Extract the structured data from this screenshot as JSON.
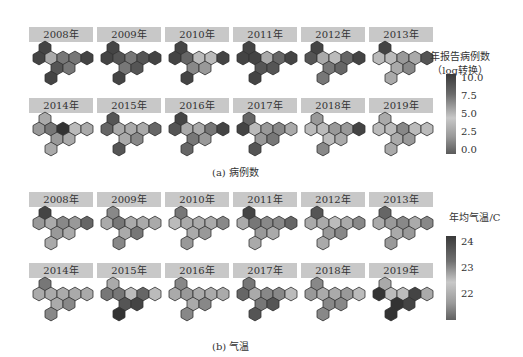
{
  "chart_data": [
    {
      "type": "heatmap",
      "subtitle": "(a) 病例数",
      "legend_title": [
        "年报告病例数",
        "（log转换）"
      ],
      "legend_ticks": [
        "10.0",
        "7.5",
        "5.0",
        "2.5",
        "0.0"
      ],
      "range": [
        0,
        10
      ],
      "panels": [
        {
          "year": "2008年",
          "cells": [
            "#444",
            "#444",
            "#aaa",
            "#777",
            "#777",
            "#444",
            "#555",
            "#777",
            "#444"
          ]
        },
        {
          "year": "2009年",
          "cells": [
            "#444",
            "#444",
            "#555",
            "#777",
            "#555",
            "#444",
            "#777",
            "#555",
            "#444"
          ]
        },
        {
          "year": "2010年",
          "cells": [
            "#444",
            "#444",
            "#666",
            "#bbb",
            "#bbb",
            "#444",
            "#888",
            "#999",
            "#444"
          ]
        },
        {
          "year": "2011年",
          "cells": [
            "#444",
            "#444",
            "#444",
            "#aaa",
            "#666",
            "#444",
            "#555",
            "#555",
            "#444"
          ]
        },
        {
          "year": "2012年",
          "cells": [
            "#444",
            "#555",
            "#aaa",
            "#bbb",
            "#666",
            "#444",
            "#777",
            "#666",
            "#777"
          ]
        },
        {
          "year": "2013年",
          "cells": [
            "#444",
            "#bbb",
            "#bbb",
            "#999",
            "#aaa",
            "#555",
            "#aaa",
            "#888",
            "#aaa"
          ]
        },
        {
          "year": "2014年",
          "cells": [
            "#aaa",
            "#999",
            "#777",
            "#333",
            "#bbb",
            "#aaa",
            "#999",
            "#aaa",
            "#aaa"
          ]
        },
        {
          "year": "2015年",
          "cells": [
            "#555",
            "#666",
            "#aaa",
            "#aaa",
            "#aaa",
            "#666",
            "#aaa",
            "#888",
            "#555"
          ]
        },
        {
          "year": "2016年",
          "cells": [
            "#444",
            "#555",
            "#aaa",
            "#aaa",
            "#777",
            "#444",
            "#777",
            "#999",
            "#666"
          ]
        },
        {
          "year": "2017年",
          "cells": [
            "#666",
            "#444",
            "#bbb",
            "#999",
            "#888",
            "#aaa",
            "#999",
            "#777",
            "#555"
          ]
        },
        {
          "year": "2018年",
          "cells": [
            "#999",
            "#bbb",
            "#bbb",
            "#999",
            "#999",
            "#444",
            "#bbb",
            "#aaa",
            "#888"
          ]
        },
        {
          "year": "2019年",
          "cells": [
            "#aaa",
            "#bbb",
            "#bbb",
            "#888",
            "#bbb",
            "#bbb",
            "#aaa",
            "#999",
            "#aaa"
          ]
        }
      ]
    },
    {
      "type": "heatmap",
      "subtitle": "(b) 气温",
      "legend_title": [
        "年均气温/C"
      ],
      "legend_ticks": [
        "24",
        "23",
        "22"
      ],
      "range": [
        21.5,
        24.3
      ],
      "panels": [
        {
          "year": "2008年",
          "cells": [
            "#444",
            "#999",
            "#aaa",
            "#888",
            "#999",
            "#666",
            "#999",
            "#aaa",
            "#aaa"
          ]
        },
        {
          "year": "2009年",
          "cells": [
            "#888",
            "#aaa",
            "#777",
            "#aaa",
            "#aaa",
            "#aaa",
            "#aaa",
            "#777",
            "#888"
          ]
        },
        {
          "year": "2010年",
          "cells": [
            "#777",
            "#bbb",
            "#aaa",
            "#aaa",
            "#aaa",
            "#888",
            "#aaa",
            "#999",
            "#999"
          ]
        },
        {
          "year": "2011年",
          "cells": [
            "#444",
            "#aaa",
            "#777",
            "#888",
            "#888",
            "#666",
            "#999",
            "#aaa",
            "#aaa"
          ]
        },
        {
          "year": "2012年",
          "cells": [
            "#555",
            "#aaa",
            "#aaa",
            "#bbb",
            "#aaa",
            "#888",
            "#999",
            "#888",
            "#aaa"
          ]
        },
        {
          "year": "2013年",
          "cells": [
            "#666",
            "#aaa",
            "#999",
            "#888",
            "#aaa",
            "#888",
            "#aaa",
            "#999",
            "#999"
          ]
        },
        {
          "year": "2014年",
          "cells": [
            "#777",
            "#aaa",
            "#aaa",
            "#aaa",
            "#aaa",
            "#aaa",
            "#aaa",
            "#888",
            "#888"
          ]
        },
        {
          "year": "2015年",
          "cells": [
            "#aaa",
            "#777",
            "#777",
            "#bbb",
            "#666",
            "#bbb",
            "#555",
            "#444",
            "#333"
          ]
        },
        {
          "year": "2016年",
          "cells": [
            "#888",
            "#aaa",
            "#999",
            "#aaa",
            "#aaa",
            "#aaa",
            "#aaa",
            "#888",
            "#888"
          ]
        },
        {
          "year": "2017年",
          "cells": [
            "#777",
            "#666",
            "#aaa",
            "#888",
            "#888",
            "#bbb",
            "#777",
            "#555",
            "#555"
          ]
        },
        {
          "year": "2018年",
          "cells": [
            "#888",
            "#999",
            "#aaa",
            "#aaa",
            "#999",
            "#bbb",
            "#888",
            "#888",
            "#888"
          ]
        },
        {
          "year": "2019年",
          "cells": [
            "#aaa",
            "#333",
            "#bbb",
            "#bbb",
            "#444",
            "#aaa",
            "#333",
            "#444",
            "#333"
          ]
        }
      ]
    }
  ],
  "captions": {
    "a": "(a) 病例数",
    "b": "(b) 气温"
  },
  "legend_a": {
    "title1": "年报告病例数",
    "title2": "（log转换）",
    "ticks": [
      "10.0",
      "7.5",
      "5.0",
      "2.5",
      "0.0"
    ]
  },
  "legend_b": {
    "title": "年均气温/C",
    "ticks": [
      "24",
      "23",
      "22"
    ]
  }
}
